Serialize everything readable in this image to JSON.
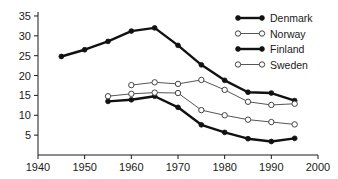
{
  "chart_data": {
    "type": "line",
    "title": "",
    "subtitle": "",
    "xlabel": "",
    "ylabel": "",
    "xlim": [
      1940,
      2000
    ],
    "ylim": [
      0,
      36
    ],
    "xticks": [
      1940,
      1950,
      1960,
      1970,
      1980,
      1990,
      2000
    ],
    "yticks": [
      5,
      10,
      15,
      20,
      25,
      30,
      35
    ],
    "grid": false,
    "legend_position": "top-right",
    "series": [
      {
        "name": "Denmark",
        "marker": "filled-circle",
        "line": "thick",
        "color": "#111111",
        "x": [
          1945,
          1950,
          1955,
          1960,
          1965,
          1970,
          1975,
          1980,
          1985,
          1990,
          1995
        ],
        "values": [
          24.8,
          26.5,
          28.6,
          31.2,
          32.0,
          27.6,
          22.7,
          18.8,
          15.8,
          15.6,
          13.7
        ]
      },
      {
        "name": "Norway",
        "marker": "open-circle",
        "line": "thin",
        "color": "#555555",
        "x": [
          1960,
          1965,
          1970,
          1975,
          1980,
          1985,
          1990,
          1995
        ],
        "values": [
          17.6,
          18.3,
          17.9,
          18.9,
          16.4,
          13.4,
          12.6,
          12.9
        ]
      },
      {
        "name": "Finland",
        "marker": "filled-circle",
        "line": "thick",
        "color": "#111111",
        "x": [
          1955,
          1960,
          1965,
          1970,
          1975,
          1980,
          1985,
          1990,
          1995
        ],
        "values": [
          13.5,
          13.9,
          14.8,
          12.0,
          7.6,
          5.7,
          4.1,
          3.4,
          4.2
        ]
      },
      {
        "name": "Sweden",
        "marker": "open-circle",
        "line": "thin",
        "color": "#555555",
        "x": [
          1955,
          1960,
          1965,
          1970,
          1975,
          1980,
          1985,
          1990,
          1995
        ],
        "values": [
          14.8,
          15.4,
          15.7,
          15.6,
          11.3,
          10.0,
          8.9,
          8.3,
          7.7
        ]
      }
    ],
    "legend": [
      {
        "label": "Denmark",
        "marker": "filled-circle",
        "line": "thick"
      },
      {
        "label": "Norway",
        "marker": "open-circle",
        "line": "thin"
      },
      {
        "label": "Finland",
        "marker": "filled-circle",
        "line": "thick"
      },
      {
        "label": "Sweden",
        "marker": "open-circle",
        "line": "thin"
      }
    ]
  }
}
